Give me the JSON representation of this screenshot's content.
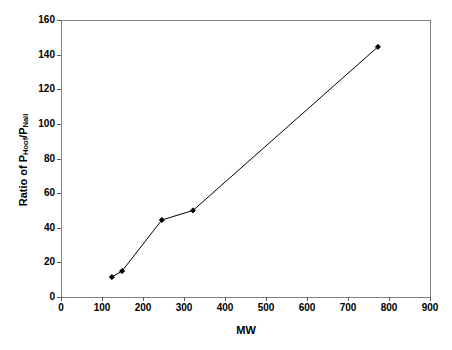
{
  "chart_data": {
    "type": "line",
    "title": "",
    "xlabel": "MW",
    "ylabel_parts": {
      "prefix": "Ratio of P",
      "sub1": "Hoof",
      "mid": "/P",
      "sub2": "Nail"
    },
    "ylabel": "Ratio of P_Hoof/P_Nail",
    "xlim": [
      0,
      900
    ],
    "ylim": [
      0,
      160
    ],
    "xticks": [
      0,
      100,
      200,
      300,
      400,
      500,
      600,
      700,
      800,
      900
    ],
    "yticks": [
      0,
      20,
      40,
      60,
      80,
      100,
      120,
      140,
      160
    ],
    "grid": false,
    "legend": "none",
    "marker": "filled-diamond",
    "line_color": "#000000",
    "marker_color": "#000000",
    "plot_border_color": "#808080",
    "background": "#ffffff",
    "series": [
      {
        "name": "Ratio of P Hoof / P Nail",
        "x": [
          124,
          149,
          246,
          322,
          773
        ],
        "values": [
          11.5,
          15,
          44.5,
          50,
          144.5
        ]
      }
    ]
  }
}
